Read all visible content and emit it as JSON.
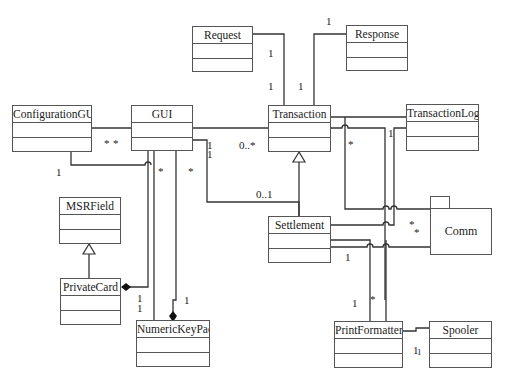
{
  "classes": {
    "request": {
      "name": "Request"
    },
    "response": {
      "name": "Response"
    },
    "configuration_gui": {
      "name": "ConfigurationGUI"
    },
    "gui": {
      "name": "GUI"
    },
    "transaction": {
      "name": "Transaction"
    },
    "transaction_log": {
      "name": "TransactionLog"
    },
    "msr_field": {
      "name": "MSRField"
    },
    "private_card": {
      "name": "PrivateCard"
    },
    "numeric_keypad": {
      "name": "NumericKeyPad"
    },
    "settlement": {
      "name": "Settlement"
    },
    "print_formatter": {
      "name": "PrintFormatter"
    },
    "spooler": {
      "name": "Spooler"
    }
  },
  "packages": {
    "comm": {
      "name": "Comm"
    }
  },
  "multiplicities": {
    "request_transaction_top": "1",
    "request_transaction_bottom": "1",
    "response_top": "1",
    "response_transaction": "1",
    "config_gui_left": "*",
    "config_gui_right": "*",
    "config_bottom": "1",
    "gui_transaction_one_a": "1",
    "gui_transaction_one_b": "1",
    "gui_transaction_many": "0..*",
    "gui_keypad_star": "*",
    "gui_settlement_star": "*",
    "settlement_01": "0..1",
    "transaction_comm_star": "*",
    "translog_one": "1",
    "comm_star_a": "*",
    "comm_star_b": "*",
    "settlement_one": "1",
    "privatecard_one_a": "1",
    "privatecard_one_b": "1",
    "keypad_one": "1",
    "printformatter_one": "1",
    "printformatter_star": "*",
    "spooler_one": "1",
    "spooler_one_b": "1"
  }
}
